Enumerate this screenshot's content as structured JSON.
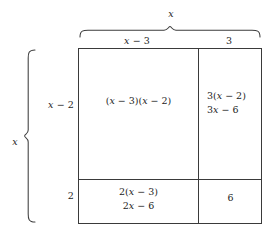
{
  "diagram": {
    "type": "area-model",
    "total_width_label": "x",
    "total_height_label": "x",
    "columns": [
      {
        "label": "x − 3",
        "name": "column-x-minus-3"
      },
      {
        "label": "3",
        "name": "column-3"
      }
    ],
    "rows": [
      {
        "label": "x − 2",
        "name": "row-x-minus-2"
      },
      {
        "label": "2",
        "name": "row-2"
      }
    ],
    "cells": {
      "top_left": {
        "line1": "(x − 3)(x − 2)",
        "line2": ""
      },
      "top_right": {
        "line1": "3(x − 2)",
        "line2": "3x − 6"
      },
      "bottom_left": {
        "line1": "2(x − 3)",
        "line2": "2x − 6"
      },
      "bottom_right": {
        "line1": "6",
        "line2": ""
      }
    },
    "colors": {
      "line": "#3a3a3a",
      "brace": "#3d3d3d",
      "text": "#1d1d1d",
      "background": "#ffffff"
    }
  }
}
